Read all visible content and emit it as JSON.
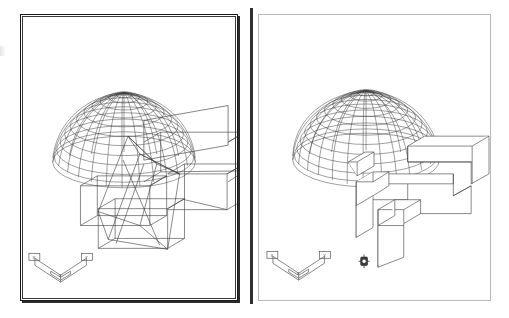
{
  "app": {
    "kind": "cad-viewport-comparison",
    "background_color": "#ffffff",
    "line_color": "#3a3a3a"
  },
  "viewports": [
    {
      "id": "left",
      "name": "wireframe-viewport",
      "title": "Wireframe",
      "border_color": "#1a1a1a",
      "border_style": "heavy-double",
      "ucs_icon": {
        "name": "ucs-axis-icon",
        "labels": {
          "x": "X",
          "y": "Y",
          "z": "Z"
        },
        "box_labels": [
          "X",
          "Y"
        ]
      },
      "objects": [
        {
          "name": "dome",
          "type": "wireframe-hemisphere",
          "meridians": 24,
          "parallels": 12
        },
        {
          "name": "base-solid",
          "type": "extruded-L-box",
          "display": "wireframe"
        },
        {
          "name": "wedge-solid",
          "type": "wedge-box",
          "display": "wireframe"
        }
      ]
    },
    {
      "id": "right",
      "name": "hidden-line-viewport",
      "title": "Hidden",
      "border_color": "#b9b9b9",
      "border_style": "thin-single",
      "ucs_icon": {
        "name": "ucs-axis-icon",
        "labels": {
          "x": "X",
          "y": "Y",
          "z": "Z"
        },
        "box_labels": [
          "X",
          "Y"
        ]
      },
      "point_marker": {
        "name": "point-marker-icon",
        "glyph": "crosshair-box"
      },
      "objects": [
        {
          "name": "dome",
          "type": "wireframe-hemisphere",
          "meridians": 24,
          "parallels": 12
        },
        {
          "name": "base-solid",
          "type": "extruded-L-box",
          "display": "hidden-line-removed"
        },
        {
          "name": "wedge-solid",
          "type": "wedge-box",
          "display": "hidden-line-removed"
        }
      ]
    }
  ]
}
